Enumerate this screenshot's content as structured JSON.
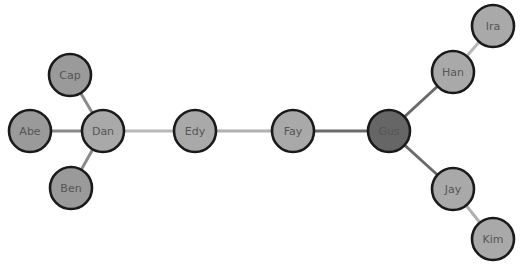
{
  "graph": {
    "type": "network",
    "node_radius": 21,
    "nodes": [
      {
        "id": "Abe",
        "label": "Abe",
        "x": 30,
        "y": 131,
        "fill": "#9a9a9a"
      },
      {
        "id": "Cap",
        "label": "Cap",
        "x": 70,
        "y": 75,
        "fill": "#9a9a9a"
      },
      {
        "id": "Ben",
        "label": "Ben",
        "x": 71,
        "y": 188,
        "fill": "#9a9a9a"
      },
      {
        "id": "Dan",
        "label": "Dan",
        "x": 103,
        "y": 131,
        "fill": "#a9a9a9"
      },
      {
        "id": "Edy",
        "label": "Edy",
        "x": 195,
        "y": 131,
        "fill": "#a9a9a9"
      },
      {
        "id": "Fay",
        "label": "Fay",
        "x": 293,
        "y": 131,
        "fill": "#a9a9a9"
      },
      {
        "id": "Gus",
        "label": "Gus",
        "x": 389,
        "y": 131,
        "fill": "#666666"
      },
      {
        "id": "Han",
        "label": "Han",
        "x": 453,
        "y": 72,
        "fill": "#a9a9a9"
      },
      {
        "id": "Ira",
        "label": "Ira",
        "x": 493,
        "y": 26,
        "fill": "#a9a9a9"
      },
      {
        "id": "Jay",
        "label": "Jay",
        "x": 453,
        "y": 189,
        "fill": "#a9a9a9"
      },
      {
        "id": "Kim",
        "label": "Kim",
        "x": 493,
        "y": 239,
        "fill": "#a9a9a9"
      }
    ],
    "edges": [
      {
        "source": "Abe",
        "target": "Dan",
        "color": "#8a8a8a",
        "width": 3
      },
      {
        "source": "Cap",
        "target": "Dan",
        "color": "#8a8a8a",
        "width": 3
      },
      {
        "source": "Ben",
        "target": "Dan",
        "color": "#8a8a8a",
        "width": 3
      },
      {
        "source": "Dan",
        "target": "Edy",
        "color": "#b8b8b8",
        "width": 3
      },
      {
        "source": "Edy",
        "target": "Fay",
        "color": "#b0b0b0",
        "width": 3
      },
      {
        "source": "Fay",
        "target": "Gus",
        "color": "#6a6a6a",
        "width": 3
      },
      {
        "source": "Gus",
        "target": "Han",
        "color": "#6a6a6a",
        "width": 3
      },
      {
        "source": "Gus",
        "target": "Jay",
        "color": "#6a6a6a",
        "width": 3
      },
      {
        "source": "Han",
        "target": "Ira",
        "color": "#b8b8b8",
        "width": 3
      },
      {
        "source": "Jay",
        "target": "Kim",
        "color": "#b0b0b0",
        "width": 3
      }
    ]
  }
}
